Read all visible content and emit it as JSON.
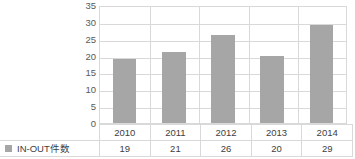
{
  "chart_data": {
    "type": "bar",
    "title": "",
    "xlabel": "",
    "ylabel": "",
    "categories": [
      "2010",
      "2011",
      "2012",
      "2013",
      "2014"
    ],
    "series": [
      {
        "name": "IN-OUT件数",
        "values": [
          19,
          21,
          26,
          20,
          29
        ],
        "color": "#a6a6a6"
      }
    ],
    "ylim": [
      0,
      35
    ],
    "yticks": [
      0,
      5,
      10,
      15,
      20,
      25,
      30,
      35
    ],
    "ytick_labels": [
      "0",
      "5",
      "10",
      "15",
      "20",
      "25",
      "30",
      "35"
    ],
    "grid": "horizontal",
    "legend_position": "data-table-left",
    "has_data_table": true
  },
  "legend": {
    "label": "IN-OUT件数",
    "swatch_icon": "legend-swatch-icon",
    "swatch_color": "#a6a6a6"
  },
  "table": {
    "header_row": [
      "",
      "2010",
      "2011",
      "2012",
      "2013",
      "2014"
    ],
    "value_row": [
      "IN-OUT件数",
      "19",
      "21",
      "26",
      "20",
      "29"
    ]
  },
  "colors": {
    "bar": "#a6a6a6",
    "gridline": "#d9d9d9",
    "border": "#d9d9d9",
    "text": "#404040",
    "axis_text": "#595959",
    "background": "#ffffff"
  }
}
